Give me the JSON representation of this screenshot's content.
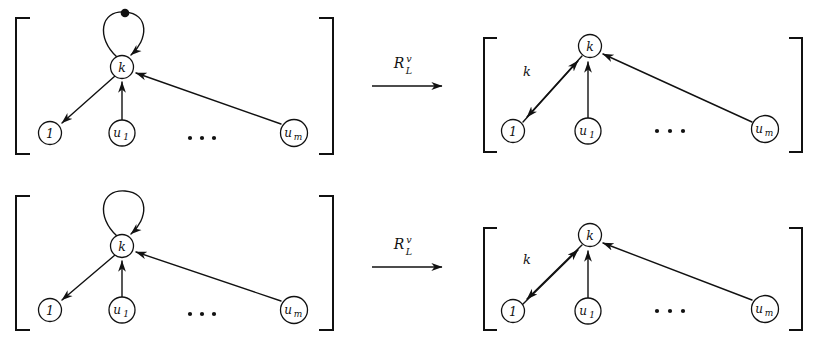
{
  "figure": {
    "background_color": "#ffffff",
    "ink_color": "#111111",
    "width": 818,
    "height": 345
  },
  "operator": {
    "base": "R",
    "subscript": "L",
    "superscript": "v",
    "arrow": "→"
  },
  "nodes": {
    "k": "k",
    "one": "1",
    "u1_base": "u",
    "u1_sub": "1",
    "um_base": "u",
    "um_sub": "m"
  },
  "labels": {
    "edge_k": "k",
    "ellipsis": "· · ·"
  },
  "rules": [
    {
      "name": "rule-top",
      "lhs": {
        "name": "lhs-top",
        "self_loop": true,
        "self_loop_marker": "filled-dot",
        "edges": [
          {
            "from": "k",
            "to": "1",
            "label": ""
          },
          {
            "from": "u1",
            "to": "k",
            "label": ""
          },
          {
            "from": "um",
            "to": "k",
            "label": ""
          },
          {
            "from": "k",
            "to": "k",
            "label": ""
          }
        ]
      },
      "rhs": {
        "name": "rhs-top",
        "self_loop": false,
        "edges": [
          {
            "from": "k",
            "to": "1",
            "label": "k"
          },
          {
            "from": "1",
            "to": "k",
            "label": ""
          },
          {
            "from": "u1",
            "to": "k",
            "label": ""
          },
          {
            "from": "um",
            "to": "k",
            "label": ""
          }
        ]
      }
    },
    {
      "name": "rule-bottom",
      "lhs": {
        "name": "lhs-bottom",
        "self_loop": true,
        "self_loop_marker": "none",
        "edges": [
          {
            "from": "k",
            "to": "1",
            "label": ""
          },
          {
            "from": "u1",
            "to": "k",
            "label": ""
          },
          {
            "from": "um",
            "to": "k",
            "label": ""
          },
          {
            "from": "k",
            "to": "k",
            "label": ""
          }
        ]
      },
      "rhs": {
        "name": "rhs-bottom",
        "self_loop": false,
        "edges": [
          {
            "from": "k",
            "to": "1",
            "label": "k"
          },
          {
            "from": "1",
            "to": "k",
            "label": ""
          },
          {
            "from": "u1",
            "to": "k",
            "label": ""
          },
          {
            "from": "um",
            "to": "k",
            "label": ""
          }
        ]
      }
    }
  ]
}
